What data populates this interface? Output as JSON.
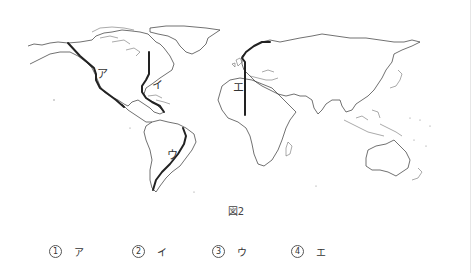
{
  "figure": {
    "caption": "図2",
    "map_labels": {
      "a": "ア",
      "i": "イ",
      "u": "ウ",
      "e": "エ"
    }
  },
  "choices": [
    {
      "number": "1",
      "label": "ア"
    },
    {
      "number": "2",
      "label": "イ"
    },
    {
      "number": "3",
      "label": "ウ"
    },
    {
      "number": "4",
      "label": "エ"
    }
  ]
}
